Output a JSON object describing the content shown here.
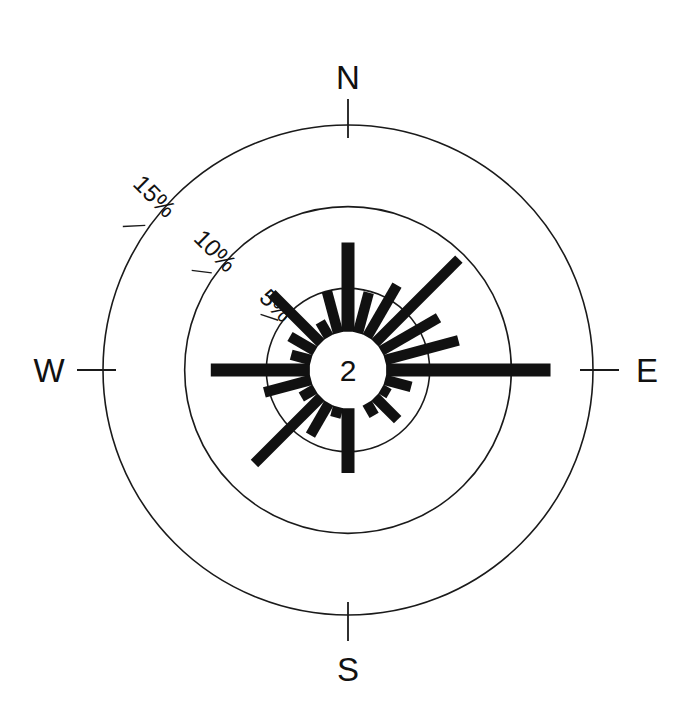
{
  "figure": {
    "kind": "rose-diagram",
    "background_color": "#ffffff",
    "ink_color": "#111111",
    "center_label": "2"
  },
  "cardinals": [
    {
      "name": "north",
      "label": "N",
      "angle_deg": 0
    },
    {
      "name": "east",
      "label": "E",
      "angle_deg": 90
    },
    {
      "name": "south",
      "label": "S",
      "angle_deg": 180
    },
    {
      "name": "west",
      "label": "W",
      "angle_deg": 270
    }
  ],
  "ring_labels": [
    {
      "name": "ring-5",
      "label": "5%",
      "value": 5
    },
    {
      "name": "ring-10",
      "label": "10%",
      "value": 10
    },
    {
      "name": "ring-15",
      "label": "15%",
      "value": 15
    }
  ],
  "chart_data": {
    "type": "bar",
    "subtype": "rose-diagram",
    "title": "",
    "xlabel": "",
    "ylabel": "",
    "units": "%",
    "angle_convention": "compass bearing, 0 = North, clockwise",
    "sector_count": 24,
    "sector_width_deg": 15,
    "radial_axis": {
      "rings": [
        5,
        10,
        15
      ],
      "tick_labels": [
        "5%",
        "10%",
        "15%"
      ],
      "rmin": 0,
      "rmax": 15,
      "grid": true,
      "label_bearing_deg": 315
    },
    "angular_axis": {
      "cardinal_ticks": [
        "N",
        "E",
        "S",
        "W"
      ],
      "tick_bearings_deg": [
        0,
        90,
        180,
        270
      ]
    },
    "center_hub": {
      "label": "2",
      "radius_percent": 1.6
    },
    "categories": [
      "0",
      "15",
      "30",
      "45",
      "60",
      "75",
      "90",
      "105",
      "120",
      "135",
      "150",
      "165",
      "180",
      "195",
      "210",
      "225",
      "240",
      "255",
      "270",
      "285",
      "300",
      "315",
      "330",
      "345"
    ],
    "values": [
      7.8,
      4.9,
      6.0,
      9.6,
      6.4,
      7.0,
      12.4,
      4.0,
      2.9,
      4.3,
      3.2,
      2.4,
      6.3,
      3.0,
      4.6,
      8.1,
      3.3,
      5.3,
      8.4,
      3.6,
      4.1,
      6.6,
      3.4,
      5.0
    ],
    "series": [
      {
        "name": "frequency",
        "values": [
          7.8,
          4.9,
          6.0,
          9.6,
          6.4,
          7.0,
          12.4,
          4.0,
          2.9,
          4.3,
          3.2,
          2.4,
          6.3,
          3.0,
          4.6,
          8.1,
          3.3,
          5.3,
          8.4,
          3.6,
          4.1,
          6.6,
          3.4,
          5.0
        ]
      }
    ],
    "legend": [],
    "annotations": [
      {
        "name": "center-count",
        "text": "2"
      }
    ]
  }
}
